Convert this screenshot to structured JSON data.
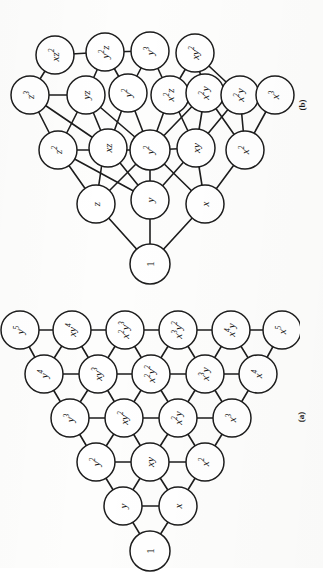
{
  "figure": {
    "background_color": "#fdfdfc",
    "ink_color": "#1d1d1d",
    "node_fill": "#ffffff",
    "orientation": "page rotated 90 degrees counter-clockwise; all labels read bottom-to-top",
    "panels": [
      {
        "id": "b",
        "caption": "(b)",
        "position": "top",
        "variables": 3,
        "max_degree": 3,
        "node_count": 20
      },
      {
        "id": "a",
        "caption": "(a)",
        "position": "bottom",
        "variables": 2,
        "max_degree": 5,
        "node_count": 21
      }
    ]
  },
  "panel_a": {
    "caption": "(a)",
    "description": "Triangular lattice of monomials in x and y up to total degree 5",
    "rows": [
      {
        "degree": 0,
        "labels": [
          "1"
        ]
      },
      {
        "degree": 1,
        "labels": [
          "y",
          "x"
        ]
      },
      {
        "degree": 2,
        "labels": [
          "y2",
          "xy",
          "x2"
        ]
      },
      {
        "degree": 3,
        "labels": [
          "y3",
          "xy2",
          "x2y",
          "x3"
        ]
      },
      {
        "degree": 4,
        "labels": [
          "y4",
          "xy3",
          "x2y2",
          "x3y",
          "x4"
        ]
      },
      {
        "degree": 5,
        "labels": [
          "y5",
          "xy4",
          "x2y3",
          "x3y2",
          "x4y",
          "x5"
        ]
      }
    ],
    "nodes": [
      {
        "id": "a0",
        "base": "1",
        "exp": "",
        "row": 0,
        "col": 0
      },
      {
        "id": "a1",
        "base": "y",
        "exp": "",
        "row": 1,
        "col": 0
      },
      {
        "id": "a2",
        "base": "x",
        "exp": "",
        "row": 1,
        "col": 1
      },
      {
        "id": "a3",
        "base": "y",
        "exp": "2",
        "row": 2,
        "col": 0
      },
      {
        "id": "a4",
        "base": "xy",
        "exp": "",
        "row": 2,
        "col": 1
      },
      {
        "id": "a5",
        "base": "x",
        "exp": "2",
        "row": 2,
        "col": 2
      },
      {
        "id": "a6",
        "base": "y",
        "exp": "3",
        "row": 3,
        "col": 0
      },
      {
        "id": "a7",
        "base": "xy",
        "exp": "2",
        "row": 3,
        "col": 1
      },
      {
        "id": "a8",
        "base": "x",
        "exp": "2",
        "row": 3,
        "col": 2,
        "tail": "y"
      },
      {
        "id": "a9",
        "base": "x",
        "exp": "3",
        "row": 3,
        "col": 3
      },
      {
        "id": "a10",
        "base": "y",
        "exp": "4",
        "row": 4,
        "col": 0
      },
      {
        "id": "a11",
        "base": "xy",
        "exp": "3",
        "row": 4,
        "col": 1
      },
      {
        "id": "a12",
        "base": "x",
        "exp": "2",
        "row": 4,
        "col": 2,
        "tail": "y",
        "tailexp": "2"
      },
      {
        "id": "a13",
        "base": "x",
        "exp": "3",
        "row": 4,
        "col": 3,
        "tail": "y"
      },
      {
        "id": "a14",
        "base": "x",
        "exp": "4",
        "row": 4,
        "col": 4
      },
      {
        "id": "a15",
        "base": "y",
        "exp": "5",
        "row": 5,
        "col": 0
      },
      {
        "id": "a16",
        "base": "xy",
        "exp": "4",
        "row": 5,
        "col": 1
      },
      {
        "id": "a17",
        "base": "x",
        "exp": "2",
        "row": 5,
        "col": 2,
        "tail": "y",
        "tailexp": "3"
      },
      {
        "id": "a18",
        "base": "x",
        "exp": "3",
        "row": 5,
        "col": 3,
        "tail": "y",
        "tailexp": "2"
      },
      {
        "id": "a19",
        "base": "x",
        "exp": "4",
        "row": 5,
        "col": 4,
        "tail": "y"
      },
      {
        "id": "a20",
        "base": "x",
        "exp": "5",
        "row": 5,
        "col": 5
      }
    ]
  },
  "panel_b": {
    "caption": "(b)",
    "description": "Lattice of monomials in x, y and z up to total degree 3",
    "groups": [
      {
        "degree": 0,
        "labels": [
          "1"
        ]
      },
      {
        "degree": 1,
        "labels": [
          "z",
          "y",
          "x"
        ]
      },
      {
        "degree": 2,
        "labels": [
          "z2",
          "yz",
          "xz",
          "y2",
          "xy",
          "x2"
        ]
      },
      {
        "degree": 3,
        "labels": [
          "z3",
          "xz2",
          "yz2",
          "y2z",
          "x2z",
          "xyz",
          "y3",
          "xy2",
          "x2y",
          "x3"
        ]
      }
    ],
    "nodes": [
      {
        "id": "b0",
        "base": "1",
        "exp": ""
      },
      {
        "id": "b1",
        "base": "z",
        "exp": ""
      },
      {
        "id": "b2",
        "base": "y",
        "exp": ""
      },
      {
        "id": "b3",
        "base": "x",
        "exp": ""
      },
      {
        "id": "b4",
        "base": "z",
        "exp": "2"
      },
      {
        "id": "b5",
        "base": "yz",
        "exp": ""
      },
      {
        "id": "b6",
        "base": "xz",
        "exp": ""
      },
      {
        "id": "b7",
        "base": "y",
        "exp": "2"
      },
      {
        "id": "b8",
        "base": "xy",
        "exp": ""
      },
      {
        "id": "b9",
        "base": "x",
        "exp": "2"
      },
      {
        "id": "b10",
        "base": "z",
        "exp": "3"
      },
      {
        "id": "b11",
        "base": "xz",
        "exp": "2"
      },
      {
        "id": "b12",
        "base": "y",
        "exp": "2",
        "tail": "z"
      },
      {
        "id": "b13",
        "base": "xz",
        "exp": "2",
        "alt": "x2z"
      },
      {
        "id": "b14",
        "base": "y",
        "exp": "2",
        "tail": "z",
        "alt": "yz2"
      },
      {
        "id": "b15",
        "base": "y",
        "exp": "3"
      },
      {
        "id": "b16",
        "base": "xy",
        "exp": "2"
      },
      {
        "id": "b17",
        "base": "x",
        "exp": "2",
        "tail": "z"
      },
      {
        "id": "b18",
        "base": "x",
        "exp": "2",
        "tail": "y"
      },
      {
        "id": "b19",
        "base": "x",
        "exp": "3"
      }
    ]
  }
}
